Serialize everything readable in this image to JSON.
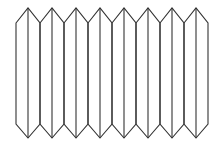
{
  "diagram": {
    "column_count": 8,
    "stroke_color": "#333333",
    "background": "#ffffff",
    "geometry": {
      "start_x": 16,
      "column_width": 24,
      "top_peak_y": 8,
      "top_shoulder_y": 23,
      "bottom_shoulder_y": 124,
      "bottom_peak_y": 138
    }
  }
}
